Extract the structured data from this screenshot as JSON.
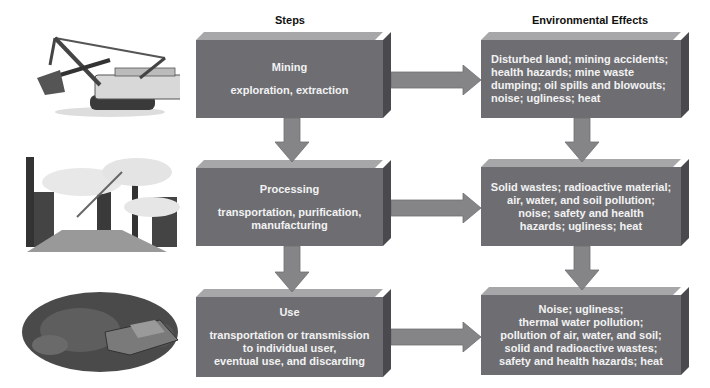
{
  "headers": {
    "steps": "Steps",
    "effects": "Environmental Effects"
  },
  "steps": [
    {
      "title": "Mining",
      "lines": [
        "exploration, extraction"
      ],
      "illustration": "power-shovel-excavator"
    },
    {
      "title": "Processing",
      "lines": [
        "transportation, purification,",
        "manufacturing"
      ],
      "illustration": "industrial-smokestacks"
    },
    {
      "title": "Use",
      "lines": [
        "transportation or transmission",
        "to individual user,",
        "eventual use, and discarding"
      ],
      "illustration": "junkyard-scrap-cars"
    }
  ],
  "effects": [
    {
      "lines": [
        "Disturbed land; mining accidents;",
        "health hazards; mine waste",
        "dumping; oil spills and blowouts;",
        "noise; ugliness; heat"
      ]
    },
    {
      "lines": [
        "Solid wastes; radioactive material;",
        "air, water, and soil pollution;",
        "noise; safety and health",
        "hazards; ugliness; heat"
      ]
    },
    {
      "lines": [
        "Noise; ugliness;",
        "thermal water pollution;",
        "pollution of air, water, and soil;",
        "solid and radioactive wastes;",
        "safety and health hazards; heat"
      ]
    }
  ],
  "colors": {
    "box_face": "#6e6e72",
    "box_top": "#a7a7aa",
    "box_side": "#4a4a4e",
    "arrow": "#858588",
    "text": "#f2f2f2"
  }
}
